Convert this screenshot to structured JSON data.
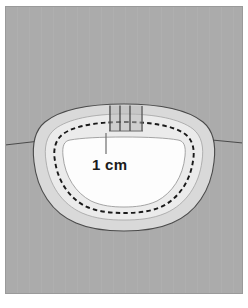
{
  "figure": {
    "caption_text": "",
    "scale_label": "1 cm",
    "background_color": "#ababab",
    "frame_color": "#ffffff",
    "outer_band_color": "#d9d9d9",
    "inner_band_color": "#ebebeb",
    "cavity_color": "#fdfdfd",
    "outline_color": "#4a4a4a",
    "dashed_line_color": "#1a1a1a",
    "horizon_line_color": "#4a4a4a",
    "marker_fill_color": "#b0b0b0",
    "leader_line_color": "#6e6e6e",
    "label_text_color": "#1b1b1b"
  },
  "annotations": {
    "scale_bar": {
      "label": "1 cm",
      "value": 1,
      "unit": "cm"
    },
    "tick_markers": {
      "count": 3,
      "names": [
        "marker-left",
        "marker-middle",
        "marker-right"
      ]
    },
    "horizon": {
      "name": "horizon-line",
      "description": "skin-line"
    }
  },
  "regions": [
    {
      "name": "background-field",
      "label": "background"
    },
    {
      "name": "outer-band",
      "label": "outer margin"
    },
    {
      "name": "inner-band",
      "label": "inner margin"
    },
    {
      "name": "dashed-excision-line",
      "label": "excision outline"
    },
    {
      "name": "cavity",
      "label": "defect cavity"
    }
  ]
}
